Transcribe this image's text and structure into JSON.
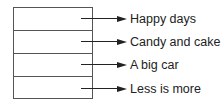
{
  "diagram": {
    "rows": [
      {
        "label": "Happy days"
      },
      {
        "label": "Candy and cake"
      },
      {
        "label": "A big car"
      },
      {
        "label": "Less is more"
      }
    ]
  }
}
